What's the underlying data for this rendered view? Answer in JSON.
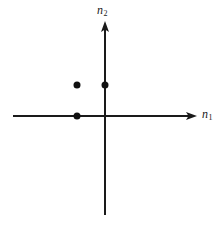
{
  "figure": {
    "background_color": "#ffffff",
    "ink_color": "#1a1a1a",
    "width": 222,
    "height": 225
  },
  "axes": {
    "horizontal": {
      "name": "n1",
      "label_text": "n",
      "label_subscript": "1",
      "arrow": "right",
      "pixel_y": 116,
      "pixel_x_start": 13,
      "pixel_x_end": 197
    },
    "vertical": {
      "name": "n2",
      "label_text": "n",
      "label_subscript": "2",
      "arrow": "up",
      "pixel_x": 105,
      "pixel_y_top": 22,
      "pixel_y_bottom": 215
    },
    "origin": {
      "x": 105,
      "y": 116
    }
  },
  "chart_data": {
    "type": "scatter",
    "title": "",
    "xlabel": "n1",
    "ylabel": "n2",
    "xlim": [
      -3.3,
      3.3
    ],
    "ylim": [
      -3.2,
      3.0
    ],
    "grid": false,
    "legend": "none",
    "marker": {
      "shape": "circle",
      "filled": true,
      "color": "#111111",
      "size_px": 7
    },
    "unit_px": {
      "x": 28,
      "y": 31
    },
    "points": [
      {
        "x": -1,
        "y": 1,
        "px": 77,
        "py": 85
      },
      {
        "x": 0,
        "y": 1,
        "px": 105,
        "py": 85
      },
      {
        "x": -1,
        "y": 0,
        "px": 77,
        "py": 116
      }
    ]
  }
}
